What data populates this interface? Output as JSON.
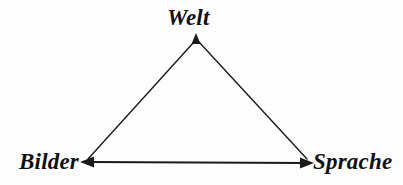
{
  "diagram": {
    "background_color": "#fdfdfd",
    "stroke_color": "#1a1a1a",
    "title": "",
    "nodes": [
      {
        "id": "welt",
        "label": "Welt",
        "x": 196,
        "y": 38,
        "label_position": "above"
      },
      {
        "id": "bilder",
        "label": "Bilder",
        "x": 84,
        "y": 162,
        "label_position": "left"
      },
      {
        "id": "sprache",
        "label": "Sprache",
        "x": 310,
        "y": 163,
        "label_position": "right"
      }
    ],
    "edges": [
      {
        "id": "bilder-welt",
        "from": "bilder",
        "to": "welt",
        "arrow_at": "both"
      },
      {
        "id": "welt-sprache",
        "from": "welt",
        "to": "sprache",
        "arrow_at": "both"
      },
      {
        "id": "bilder-sprache",
        "from": "bilder",
        "to": "sprache",
        "arrow_at": "both"
      }
    ]
  }
}
